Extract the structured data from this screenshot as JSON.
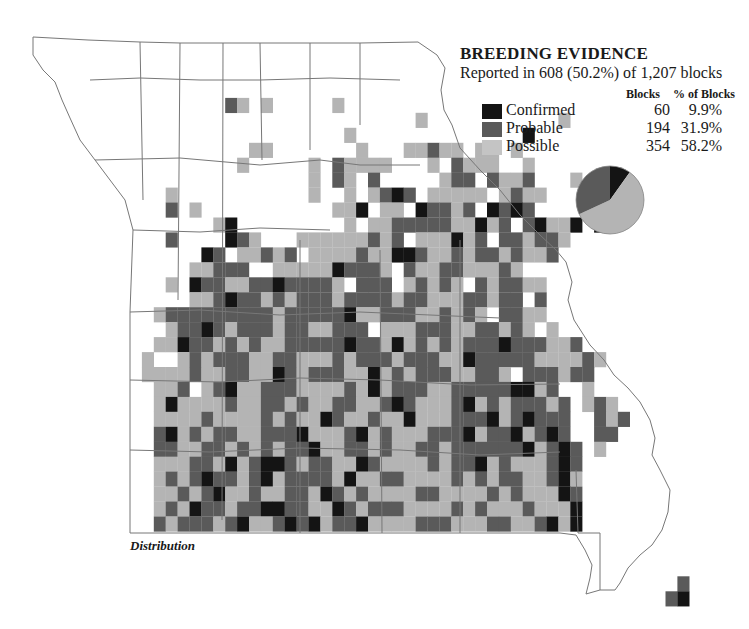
{
  "legend": {
    "title": "BREEDING EVIDENCE",
    "subtitle": "Reported in 608 (50.2%) of 1,207 blocks",
    "col_blocks": "Blocks",
    "col_pct": "% of Blocks",
    "rows": [
      {
        "label": "Confirmed",
        "blocks": "60",
        "pct": "9.9%",
        "color": "#141414"
      },
      {
        "label": "Probable",
        "blocks": "194",
        "pct": "31.9%",
        "color": "#5a5a5a"
      },
      {
        "label": "Possible",
        "blocks": "354",
        "pct": "58.2%",
        "color": "#b4b4b4"
      }
    ]
  },
  "caption": "Distribution",
  "chart_data": {
    "type": "pie",
    "title": "BREEDING EVIDENCE",
    "subtitle": "Reported in 608 (50.2%) of 1,207 blocks",
    "categories": [
      "Confirmed",
      "Probable",
      "Possible"
    ],
    "values": [
      60,
      194,
      354
    ],
    "percentages": [
      9.9,
      31.9,
      58.2
    ],
    "colors": [
      "#141414",
      "#5a5a5a",
      "#b4b4b4"
    ]
  },
  "grid": {
    "x0": 130,
    "y0": 68,
    "cw": 11.9,
    "ch": 14.95,
    "colors": {
      "c": "#141414",
      "p": "#5a5a5a",
      "s": "#b4b4b4"
    },
    "rows": [
      "..........................................",
      "...........................................",
      "........ps.s.....s.........................",
      "........................s...........s......",
      "..................s..............c..........",
      "..........ss.......s...sspss.ss.s...........",
      ".........s.....s.pssss...s.psss..s.........",
      "...............s.ps.p.....spp.pssp...s.....",
      "...s...........s..s.spcp.sssss.spss.........",
      "...p.s...........ssc.ss.cppsp.cpcp..........",
      ".......sc.........s.sspppppsscsp.pcssc.c....",
      "...p....cps...sssssspsp.ssscsp.ppspps.......",
      "......cp.sspsp.sssspssccpsspsppspssp........",
      ".....ssppp..ssssscppps.pssppsssps...........",
      "...s.cppssppcpppps.ppp.spsps.psppss.........",
      ".....sspcppspspppsppppsppsssppspp.p..........",
      "..spppppppppspppppcsspppsspsps.ppss.........",
      "...sppcpspppsppssppp.ssspppssppsps.s........",
      "..sscppspspsspppppcppscspspspppcpppssp......",
      ".s..spspppssppssspspppspppsscpppppssssps....",
      ".sssspssppsscpspppsscspspppsspps.pppspp.....",
      "..ssp.spcsspppsssspscspppsspppppccsp..s.....",
      "..scsssspssppspssppsspcpssspcspspppsp.sps...",
      "..sssspsssspspsscpsspsscssspppcspcppp..psp..",
      "..pcspsppsspppcssspcspssspppcsppcspcp..pp...",
      "..ppssppspspsppcssppspssppsppppppcspcp.s....",
      "..sssppscspccpsppsscpsssspsppcspssspcp......",
      "..spspcppspcsppppscssppsssspspsppsspcs......",
      "..sspspcsspssppscpspssssppsssspspssscp......",
      "..spscppsppccppsscpspppsssspspssspsssc......",
      "..pspppspcsspcpcsppcsssspppsssppsspcsc......",
      "..............................................",
      "..............................................",
      ".............................................",
      "..............................................p..",
      ".............................................pc.."
    ]
  }
}
